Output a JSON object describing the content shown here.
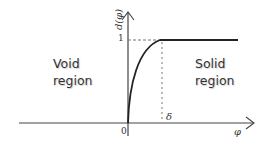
{
  "diagram": {
    "type": "step-function-plot",
    "y_axis_label": "d(φ)",
    "x_axis_label": "φ",
    "origin_label": "0",
    "y_tick_label": "1",
    "x_marker_label": "δ",
    "left_region": {
      "line1": "Void",
      "line2": "region"
    },
    "right_region": {
      "line1": "Solid",
      "line2": "region"
    },
    "colors": {
      "line": "#222222",
      "dashed": "#777777",
      "text": "#333333",
      "background": "#ffffff"
    }
  }
}
